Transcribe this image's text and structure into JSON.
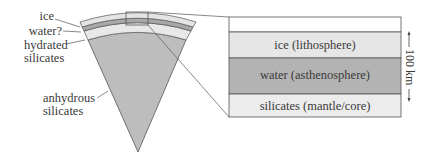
{
  "wedge": {
    "labels": {
      "ice": "ice",
      "water": "water?",
      "hydrated_line1": "hydrated",
      "hydrated_line2": "silicates",
      "anhydrous_line1": "anhydrous",
      "anhydrous_line2": "silicates"
    }
  },
  "detail_box": {
    "layers": [
      {
        "label": "",
        "fill": "#ffffff"
      },
      {
        "label": "ice (lithosphere)",
        "fill": "#e6e6e6"
      },
      {
        "label": "water (asthenosphere)",
        "fill": "#b3b3b3"
      },
      {
        "label": "silicates (mantle/core)",
        "fill": "#ececec"
      }
    ],
    "scale_label": "100 km"
  },
  "colors": {
    "core": "#bdbdbd",
    "hydrated": "#e8e8e8",
    "water": "#a8a8a8",
    "ice": "#e4e4e4",
    "outline": "#555555"
  }
}
